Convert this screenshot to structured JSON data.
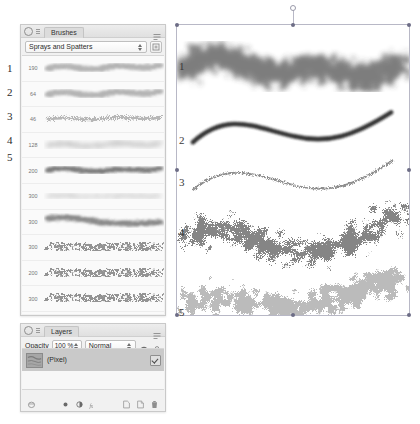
{
  "brushes_panel": {
    "title": "Brushes",
    "menu_icon": "panel-menu-icon",
    "category": {
      "label": "Sprays and Spatters",
      "options": [
        "Sprays and Spatters"
      ]
    },
    "category_button_icon": "brush-options-icon",
    "rows": [
      {
        "size": "190",
        "kind": "soft-spray"
      },
      {
        "size": "64",
        "kind": "soft-spray"
      },
      {
        "size": "46",
        "kind": "fine-spray"
      },
      {
        "size": "128",
        "kind": "textured-spray"
      },
      {
        "size": "200",
        "kind": "dense-stroke"
      },
      {
        "size": "300",
        "kind": "light-spray"
      },
      {
        "size": "300",
        "kind": "tapered-stroke"
      },
      {
        "size": "300",
        "kind": "spatter"
      },
      {
        "size": "200",
        "kind": "spatter"
      },
      {
        "size": "300",
        "kind": "spatter"
      },
      {
        "size": "200",
        "kind": "spatter-coarse"
      },
      {
        "size": "200",
        "kind": "spatter-coarse"
      },
      {
        "size": "200",
        "kind": "spatter-fine"
      },
      {
        "size": "300",
        "kind": "spatter-fine"
      }
    ]
  },
  "layers_panel": {
    "title": "Layers",
    "menu_icon": "panel-menu-icon",
    "opacity_label": "Opacity",
    "opacity_value": "100 %",
    "blend_mode": "Normal",
    "blend_options": [
      "Normal"
    ],
    "gear_icon": "gear-icon",
    "lock_icon": "lock-icon",
    "layers": [
      {
        "name": "(Pixel)",
        "visible": true,
        "selected": true
      }
    ],
    "toolbar": {
      "left_icon": "layer-effects-icon",
      "mid_icons": [
        "fill-layer-icon",
        "adjustment-layer-icon",
        "fx-icon"
      ],
      "right_icons": [
        "mask-layer-icon",
        "add-layer-icon",
        "delete-layer-icon"
      ]
    }
  },
  "annotations": {
    "panel_numbers": [
      "1",
      "2",
      "3",
      "4",
      "5"
    ],
    "canvas_numbers": [
      "1",
      "2",
      "3",
      "4",
      "5"
    ]
  },
  "canvas": {
    "selection_handles": 8,
    "rotation_handle": "rotate-handle",
    "strokes": [
      {
        "label": "1",
        "style": "broad-soft-spray"
      },
      {
        "label": "2",
        "style": "solid-tapered"
      },
      {
        "label": "3",
        "style": "thin-textured"
      },
      {
        "label": "4",
        "style": "coarse-spatter"
      },
      {
        "label": "5",
        "style": "fine-spatter"
      }
    ]
  },
  "colors": {
    "panel_bg": "#f1f1f1",
    "panel_border": "#c9c9c9",
    "selection": "#b8b8c6",
    "layer_selected": "#c9c9c9",
    "ink": "#2b2b2b"
  }
}
